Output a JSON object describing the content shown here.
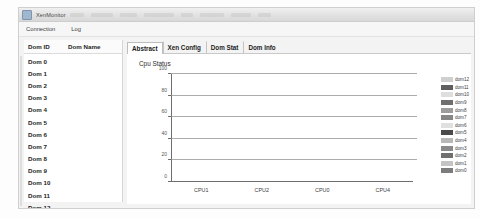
{
  "window": {
    "title": "XenMonitor",
    "app_icon": "app-icon"
  },
  "menubar": {
    "items": [
      {
        "label": "Connection"
      },
      {
        "label": "Log"
      }
    ]
  },
  "dom_list": {
    "headers": {
      "id": "Dom ID",
      "name": "Dom Name"
    },
    "rows": [
      {
        "id": "Dom 0",
        "name": ""
      },
      {
        "id": "Dom 1",
        "name": ""
      },
      {
        "id": "Dom 2",
        "name": ""
      },
      {
        "id": "Dom 3",
        "name": ""
      },
      {
        "id": "Dom 4",
        "name": ""
      },
      {
        "id": "Dom 5",
        "name": ""
      },
      {
        "id": "Dom 6",
        "name": ""
      },
      {
        "id": "Dom 7",
        "name": ""
      },
      {
        "id": "Dom 8",
        "name": ""
      },
      {
        "id": "Dom 9",
        "name": ""
      },
      {
        "id": "Dom 10",
        "name": ""
      },
      {
        "id": "Dom 11",
        "name": ""
      },
      {
        "id": "Dom 12",
        "name": ""
      }
    ]
  },
  "tabs": [
    {
      "label": "Abstract",
      "active": true
    },
    {
      "label": "Xen Config",
      "active": false
    },
    {
      "label": "Dom Stat",
      "active": false
    },
    {
      "label": "Dom Info",
      "active": false
    }
  ],
  "chart_data": {
    "type": "bar",
    "title": "Cpu Status",
    "xlabel": "",
    "ylabel": "",
    "ylim": [
      0,
      100
    ],
    "yticks": [
      0,
      20,
      40,
      60,
      80,
      100
    ],
    "grid": true,
    "stacked": true,
    "legend_position": "right",
    "categories": [
      "CPU1",
      "CPU2",
      "CPU0",
      "CPU4"
    ],
    "totals": [
      22,
      42,
      15,
      31
    ],
    "series": [
      {
        "name": "dom0",
        "color": "#7a7a7a",
        "values": [
          11,
          36,
          14,
          19
        ]
      },
      {
        "name": "dom1",
        "color": "#9a9a9a",
        "values": [
          0,
          0,
          0,
          0
        ]
      },
      {
        "name": "dom2",
        "color": "#6e6e6e",
        "values": [
          0,
          0,
          0,
          0
        ]
      },
      {
        "name": "dom3",
        "color": "#8c8c8c",
        "values": [
          0,
          0,
          0,
          0
        ]
      },
      {
        "name": "dom4",
        "color": "#b5b5b5",
        "values": [
          0,
          0,
          0,
          0
        ]
      },
      {
        "name": "dom5",
        "color": "#4a4a4a",
        "values": [
          0,
          0,
          0,
          0
        ]
      },
      {
        "name": "dom6",
        "color": "#d8d8d8",
        "values": [
          0,
          0,
          0,
          0
        ]
      },
      {
        "name": "dom7",
        "color": "#8a8a8a",
        "values": [
          0,
          0,
          0,
          0
        ]
      },
      {
        "name": "dom8",
        "color": "#a2a2a2",
        "values": [
          0,
          0,
          0,
          0
        ]
      },
      {
        "name": "dom9",
        "color": "#707070",
        "values": [
          0,
          0,
          0,
          0
        ]
      },
      {
        "name": "dom10",
        "color": "#dcdcdc",
        "values": [
          0,
          0,
          0,
          0
        ]
      },
      {
        "name": "dom11",
        "color": "#666666",
        "values": [
          11,
          0,
          1,
          7
        ]
      },
      {
        "name": "dom12",
        "color": "#cccccc",
        "values": [
          0,
          6,
          0,
          5
        ]
      }
    ],
    "legend_entries": [
      {
        "label": "dom12",
        "color": "#cfcfcf"
      },
      {
        "label": "dom11",
        "color": "#5f5f5f"
      },
      {
        "label": "dom10",
        "color": "#dedede"
      },
      {
        "label": "dom9",
        "color": "#6f6f6f"
      },
      {
        "label": "dom8",
        "color": "#9d9d9d"
      },
      {
        "label": "dom7",
        "color": "#878787"
      },
      {
        "label": "dom6",
        "color": "#e0e0e0"
      },
      {
        "label": "dom5",
        "color": "#4a4a4a"
      },
      {
        "label": "dom4",
        "color": "#b8b8b8"
      },
      {
        "label": "dom3",
        "color": "#8a8a8a"
      },
      {
        "label": "dom2",
        "color": "#707070"
      },
      {
        "label": "dom1",
        "color": "#c4c4c4"
      },
      {
        "label": "dom0",
        "color": "#7c7c7c"
      }
    ],
    "bar_segments": [
      {
        "category": "CPU1",
        "segments": [
          {
            "label": "dom0",
            "value": 11,
            "color": "#7f7f7f"
          },
          {
            "label": "dom11",
            "value": 11,
            "color": "#a0a0a0"
          }
        ]
      },
      {
        "category": "CPU2",
        "segments": [
          {
            "label": "dom0",
            "value": 36,
            "color": "#7f7f7f"
          },
          {
            "label": "dom12",
            "value": 6,
            "color": "#d2d2d2"
          }
        ]
      },
      {
        "category": "CPU0",
        "segments": [
          {
            "label": "dom0",
            "value": 14,
            "color": "#6e6e6e"
          },
          {
            "label": "dom11",
            "value": 1,
            "color": "#9a9a9a"
          }
        ]
      },
      {
        "category": "CPU4",
        "segments": [
          {
            "label": "dom0",
            "value": 19,
            "color": "#9b9b9b"
          },
          {
            "label": "dom11",
            "value": 7,
            "color": "#848484"
          },
          {
            "label": "dom12",
            "value": 5,
            "color": "#666666"
          }
        ]
      }
    ]
  }
}
